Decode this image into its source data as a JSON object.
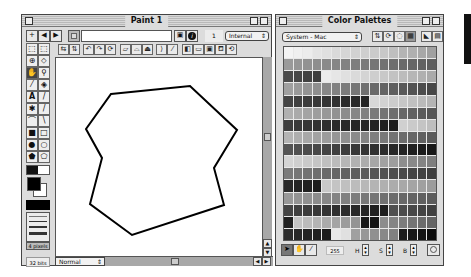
{
  "paint_window": {
    "title": "Paint 1",
    "nav": {
      "add": "+",
      "prev": "◀",
      "next": "▶"
    },
    "name_field_value": "",
    "frame_number": "1",
    "ink_select": "Internal",
    "info_icon": "i",
    "tools": [
      {
        "name": "marquee",
        "glyph": "⬚"
      },
      {
        "name": "lasso",
        "glyph": "⌒"
      },
      {
        "name": "registration",
        "glyph": "⊕"
      },
      {
        "name": "eraser",
        "glyph": "◇"
      },
      {
        "name": "hand",
        "glyph": "✋"
      },
      {
        "name": "magnifier",
        "glyph": "🔍"
      },
      {
        "name": "eyedropper",
        "glyph": "✎"
      },
      {
        "name": "paint-bucket",
        "glyph": "⛽"
      },
      {
        "name": "text",
        "glyph": "A"
      },
      {
        "name": "pencil",
        "glyph": "/"
      },
      {
        "name": "air-brush",
        "glyph": "✱"
      },
      {
        "name": "brush",
        "glyph": "/"
      },
      {
        "name": "arc",
        "glyph": "⌒"
      },
      {
        "name": "line",
        "glyph": "\\"
      },
      {
        "name": "filled-rect",
        "glyph": "■"
      },
      {
        "name": "rect",
        "glyph": "□"
      },
      {
        "name": "filled-ellipse",
        "glyph": "●"
      },
      {
        "name": "ellipse",
        "glyph": "○"
      },
      {
        "name": "filled-polygon",
        "glyph": "⬟"
      },
      {
        "name": "polygon",
        "glyph": "⬠"
      }
    ],
    "line_width_label": "4 pixels",
    "bit_depth": "32 bits",
    "ink_mode": "Normal",
    "polygon_points": [
      [
        110,
        93
      ],
      [
        189,
        85
      ],
      [
        236,
        129
      ],
      [
        213,
        167
      ],
      [
        223,
        204
      ],
      [
        131,
        234
      ],
      [
        89,
        203
      ],
      [
        101,
        157
      ],
      [
        85,
        128
      ]
    ]
  },
  "palette_window": {
    "title": "Color Palettes",
    "palette_select": "System - Mac",
    "color_index": "255",
    "h_label": "H",
    "s_label": "S",
    "b_label": "B",
    "colors": [
      [
        "#f4f4f4",
        "#f0f0f0",
        "#ececec",
        "#e4e4e4",
        "#e0e0e0",
        "#dadada",
        "#d6d6d6",
        "#d2d2d2",
        "#cfcfcf",
        "#cbcbcb",
        "#c8c8c8",
        "#bfbfbf",
        "#b4b4b4",
        "#b0b0b0",
        "#a8a8a8",
        "#a0a0a0"
      ],
      [
        "#9a9a9a",
        "#969696",
        "#929292",
        "#8e8e8e",
        "#8a8a8a",
        "#868686",
        "#828282",
        "#7e7e7e",
        "#7a7a7a",
        "#767676",
        "#727272",
        "#6e6e6e",
        "#6a6a6a",
        "#666666",
        "#626262",
        "#5e5e5e"
      ],
      [
        "#4a4a4a",
        "#464646",
        "#424242",
        "#3e3e3e",
        "#ececec",
        "#e6e6e6",
        "#e0e0e0",
        "#dadada",
        "#d4d4d4",
        "#cecece",
        "#c8c8c8",
        "#c2c2c2",
        "#bcbcbc",
        "#b6b6b6",
        "#b0b0b0",
        "#aaaaaa"
      ],
      [
        "#a0a0a0",
        "#9a9a9a",
        "#949494",
        "#8e8e8e",
        "#888888",
        "#828282",
        "#7c7c7c",
        "#767676",
        "#707070",
        "#6a6a6a",
        "#646464",
        "#5e5e5e",
        "#585858",
        "#525252",
        "#4c4c4c",
        "#464646"
      ],
      [
        "#444444",
        "#404040",
        "#3c3c3c",
        "#383838",
        "#343434",
        "#303030",
        "#2c2c2c",
        "#282828",
        "#242424",
        "#d8d8d8",
        "#d2d2d2",
        "#cccccc",
        "#c6c6c6",
        "#c0c0c0",
        "#bababa",
        "#b4b4b4"
      ],
      [
        "#b0b0b0",
        "#aaaaaa",
        "#a4a4a4",
        "#9e9e9e",
        "#989898",
        "#929292",
        "#8c8c8c",
        "#868686",
        "#808080",
        "#7a7a7a",
        "#747474",
        "#6e6e6e",
        "#686868",
        "#626262",
        "#5c5c5c",
        "#565656"
      ],
      [
        "#3e3e3e",
        "#3a3a3a",
        "#363636",
        "#323232",
        "#2e2e2e",
        "#2a2a2a",
        "#282828",
        "#262626",
        "#242424",
        "#222222",
        "#202020",
        "#1e1e1e",
        "#d0d0d0",
        "#cacaca",
        "#c4c4c4",
        "#bebebe"
      ],
      [
        "#b4b4b4",
        "#aeaeae",
        "#a8a8a8",
        "#a2a2a2",
        "#9c9c9c",
        "#969696",
        "#909090",
        "#8a8a8a",
        "#848484",
        "#7e7e7e",
        "#787878",
        "#727272",
        "#6c6c6c",
        "#666666",
        "#606060",
        "#5a5a5a"
      ],
      [
        "#545454",
        "#505050",
        "#4c4c4c",
        "#484848",
        "#444444",
        "#404040",
        "#3c3c3c",
        "#383838",
        "#343434",
        "#303030",
        "#2c2c2c",
        "#282828",
        "#242424",
        "#202020",
        "#1c1c1c",
        "#181818"
      ],
      [
        "#d4d4d4",
        "#cfcfcf",
        "#cacaca",
        "#c5c5c5",
        "#c0c0c0",
        "#bbbbbb",
        "#b6b6b6",
        "#b1b1b1",
        "#acacac",
        "#a7a7a7",
        "#a2a2a2",
        "#9d9d9d",
        "#8e8e8e",
        "#898989",
        "#848484",
        "#7f7f7f"
      ],
      [
        "#7a7a7a",
        "#767676",
        "#727272",
        "#6e6e6e",
        "#6a6a6a",
        "#666666",
        "#626262",
        "#5e5e5e",
        "#5a5a5a",
        "#565656",
        "#525252",
        "#4e4e4e",
        "#4a4a4a",
        "#464646",
        "#424242",
        "#3e3e3e"
      ],
      [
        "#282828",
        "#242424",
        "#202020",
        "#1c1c1c",
        "#c8c8c8",
        "#c4c4c4",
        "#c0c0c0",
        "#bcbcbc",
        "#b8b8b8",
        "#b4b4b4",
        "#b0b0b0",
        "#acacac",
        "#a8a8a8",
        "#a4a4a4",
        "#a0a0a0",
        "#9c9c9c"
      ],
      [
        "#989898",
        "#949494",
        "#909090",
        "#8c8c8c",
        "#888888",
        "#848484",
        "#808080",
        "#7c7c7c",
        "#787878",
        "#747474",
        "#707070",
        "#6c6c6c",
        "#686868",
        "#646464",
        "#606060",
        "#5c5c5c"
      ],
      [
        "#444444",
        "#404040",
        "#3c3c3c",
        "#383838",
        "#343434",
        "#303030",
        "#2c2c2c",
        "#282828",
        "#242424",
        "#202020",
        "#1c1c1c",
        "#505050",
        "#4c4c4c",
        "#484848",
        "#444444",
        "#404040"
      ],
      [
        "#202020",
        "#c4c4c4",
        "#bcbcbc",
        "#b4b4b4",
        "#acacac",
        "#a4a4a4",
        "#9c9c9c",
        "#949494",
        "#181818",
        "#141414",
        "#8c8c8c",
        "#848484",
        "#7c7c7c",
        "#747474",
        "#6c6c6c",
        "#646464"
      ],
      [
        "#2c2c2c",
        "#282828",
        "#242424",
        "#202020",
        "#1c1c1c",
        "#e8e8e8",
        "#e0e0e0",
        "#a0a0a0",
        "#989898",
        "#909090",
        "#888888",
        "#808080",
        "#1c1c1c",
        "#181818",
        "#141414",
        "#0c0c0c"
      ]
    ]
  }
}
